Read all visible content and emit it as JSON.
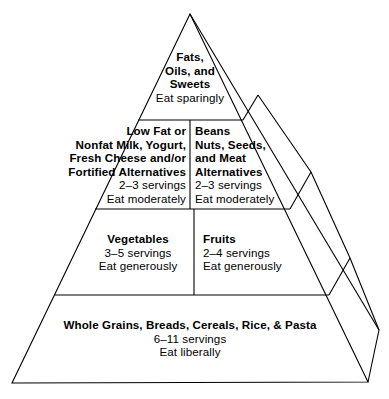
{
  "diagram": {
    "type": "food-pyramid",
    "line_color": "#000000",
    "background_color": "#ffffff",
    "tiers": [
      {
        "id": "tier-1",
        "level": 1,
        "cells": [
          {
            "id": "fats-oils-sweets",
            "name_lines": [
              "Fats,",
              "Oils, and",
              "Sweets"
            ],
            "servings": "",
            "advice": "Eat sparingly"
          }
        ]
      },
      {
        "id": "tier-2",
        "level": 2,
        "cells": [
          {
            "id": "milk-group",
            "name_lines": [
              "Low Fat or",
              "Nonfat Milk, Yogurt,",
              "Fresh Cheese and/or",
              "Fortified  Alternatives"
            ],
            "servings": "2–3 servings",
            "advice": "Eat moderately"
          },
          {
            "id": "beans-nuts-meat-group",
            "name_lines": [
              "Beans",
              "Nuts, Seeds,",
              "and Meat",
              "Alternatives"
            ],
            "servings": "2–3 servings",
            "advice": "Eat moderately"
          }
        ]
      },
      {
        "id": "tier-3",
        "level": 3,
        "cells": [
          {
            "id": "vegetables-group",
            "name_lines": [
              "Vegetables"
            ],
            "servings": "3–5 servings",
            "advice": "Eat generously"
          },
          {
            "id": "fruits-group",
            "name_lines": [
              "Fruits"
            ],
            "servings": "2–4 servings",
            "advice": "Eat generously"
          }
        ]
      },
      {
        "id": "tier-4",
        "level": 4,
        "cells": [
          {
            "id": "grains-group",
            "name_lines": [
              "Whole Grains, Breads, Cereals, Rice, & Pasta"
            ],
            "servings": "6–11 servings",
            "advice": "Eat liberally"
          }
        ]
      }
    ]
  }
}
